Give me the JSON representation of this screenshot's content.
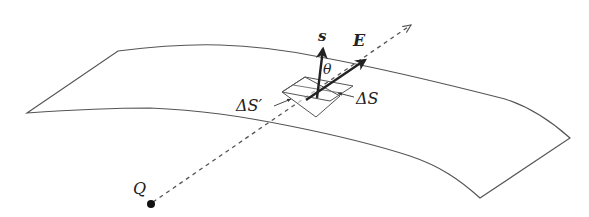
{
  "figure": {
    "labels": {
      "normal_vector": "s",
      "field_vector": "E",
      "angle": "θ",
      "patch": "ΔS",
      "projected_patch": "ΔS′",
      "charge": "Q"
    },
    "colors": {
      "stroke": "#555555",
      "arrow": "#222222",
      "background": "#ffffff"
    }
  }
}
